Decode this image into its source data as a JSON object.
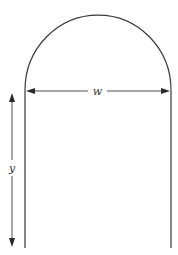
{
  "figure": {
    "type": "diagram",
    "shape": {
      "name": "norman-window-outline",
      "parts": [
        "semicircular-arch",
        "left-side",
        "right-side"
      ]
    },
    "dimensions": {
      "width": {
        "label": "w",
        "orientation": "horizontal",
        "spans": "full width at base of semicircle"
      },
      "height": {
        "label": "y",
        "orientation": "vertical",
        "spans": "height of rectangular part"
      }
    },
    "colors": {
      "stroke": "#3a3a3a",
      "background": "#ffffff"
    }
  }
}
